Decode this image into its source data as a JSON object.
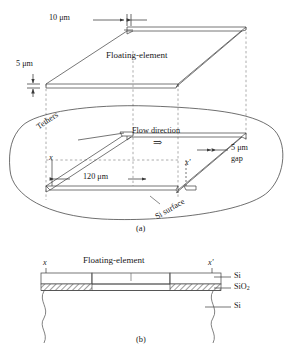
{
  "figure": {
    "panel_a": {
      "caption": "(a)",
      "labels": {
        "dim_width": "10 μm",
        "dim_thickness": "5 μm",
        "element": "Floating-element",
        "tethers": "Tethers",
        "flow": "Flow direction",
        "flow_arrow": "⇒",
        "gap_line1": "5 μm",
        "gap_line2": "gap",
        "dim_length": "120 μm",
        "section_start": "x",
        "section_end": "x'",
        "surface": "Si surface"
      }
    },
    "panel_b": {
      "caption": "(b)",
      "labels": {
        "element": "Floating-element",
        "section_start": "x",
        "section_end": "x'",
        "layer_top": "Si",
        "layer_mid": "SiO",
        "layer_mid_sub": "2",
        "layer_bottom": "Si"
      }
    },
    "colors": {
      "line": "#4a4a4a",
      "dash": "#6e6e6e",
      "text": "#181818",
      "background": "#ffffff"
    }
  }
}
